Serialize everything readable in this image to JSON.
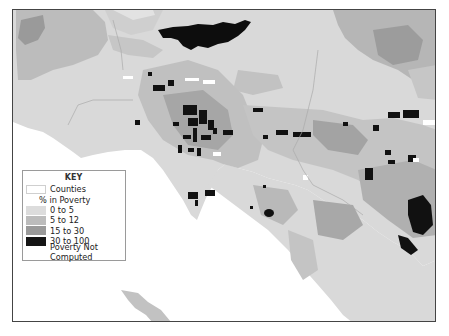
{
  "map": {
    "region": "Los Angeles area census tracts",
    "colors": {
      "water": "#ffffff",
      "county_fill": "#d9d9d9",
      "poverty_0_5": "#d9d9d9",
      "poverty_5_12": "#bdbdbd",
      "poverty_15_30": "#9c9c9c",
      "poverty_30_100": "#111111",
      "not_computed": "#ffffff",
      "frame_border": "#444444"
    }
  },
  "legend": {
    "title": "KEY",
    "counties_label": "Counties",
    "subheading": "% in Poverty",
    "items": [
      {
        "label": "0 to 5",
        "color": "#dcdcdc"
      },
      {
        "label": "5 to 12",
        "color": "#bcbcbc"
      },
      {
        "label": "15 to 30",
        "color": "#9a9a9a"
      },
      {
        "label": "30 to 100",
        "color": "#151515"
      }
    ],
    "not_computed_label": "Poverty Not Computed"
  }
}
